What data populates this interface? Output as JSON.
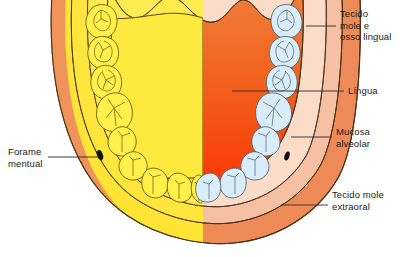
{
  "figure": {
    "kind": "anatomical-illustration",
    "language": "pt-BR"
  },
  "labels": {
    "tecido_mole_osso_lingual": "Tecido\nmole e\nosso lingual",
    "lingua": "Língua",
    "mucosa_alveolar": "Mucosa\nalveolar",
    "tecido_mole_extraoral": "Tecido mole\nextraoral",
    "forame_mentual": "Forame\nmentual"
  },
  "colors": {
    "outer_soft_tissue": "#ee8a58",
    "outer_soft_tissue_light": "#f1a47c",
    "mucosa_band": "#f7c3a8",
    "mucosa_band_inner": "#f8d3bd",
    "bone_yellow": "#ffe843",
    "bone_yellow_light": "#fff06e",
    "tooth_yellow": "#fff04a",
    "tooth_blue": "#d6ecf7",
    "tooth_blue_edge": "#b8dced",
    "tongue_top": "#ef7534",
    "tongue_bottom": "#f93c06",
    "tongue_yellow": "#ffe843",
    "outline": "#3a2a18",
    "leader_line": "#2b2b2b",
    "text": "#1a1a1a",
    "foramen": "#141414",
    "background": "#ffffff"
  },
  "anatomy": {
    "left_half_description": "bone / osseous half rendered in yellow",
    "right_half_description": "soft tissue half rendered in orange-salmon",
    "teeth_left_count": 8,
    "teeth_right_count": 8,
    "foramen_markers": 2,
    "tongue_present": true
  }
}
